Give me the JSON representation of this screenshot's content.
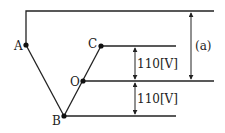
{
  "diagram": {
    "nodes": {
      "A": {
        "label": "A"
      },
      "B": {
        "label": "B"
      },
      "C": {
        "label": "C"
      },
      "O": {
        "label": "O"
      }
    },
    "annotations": {
      "upper_voltage": "110[V]",
      "lower_voltage": "110[V]",
      "unknown": "(a)"
    },
    "colors": {
      "line": "#222222",
      "background": "#ffffff"
    }
  }
}
